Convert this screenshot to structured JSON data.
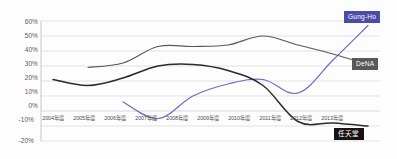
{
  "chart_data": {
    "type": "line",
    "title": "",
    "subtitle": "",
    "xlabel": "",
    "ylabel": "",
    "x": [
      "2004年度",
      "2005年度",
      "2006年度",
      "2007年度",
      "2008年度",
      "2009年度",
      "2010年度",
      "2011年度",
      "2012年度",
      "2013年度"
    ],
    "ylim": [
      -20,
      60
    ],
    "ytick_labels": [
      "60%",
      "50%",
      "40%",
      "30%",
      "20%",
      "10%",
      "0%",
      "-10%",
      "-20%"
    ],
    "ytick_values": [
      60,
      50,
      40,
      30,
      20,
      10,
      0,
      -10,
      -20
    ],
    "grid": true,
    "legend_position": "line-end-labels",
    "series": [
      {
        "name": "Gung-Ho",
        "color": "#6b6bc4",
        "values": [
          null,
          null,
          6,
          -5,
          10,
          18,
          21,
          12,
          34,
          57
        ]
      },
      {
        "name": "DeNA",
        "color": "#5a5a5a",
        "values": [
          null,
          29,
          32,
          43,
          43,
          44,
          50,
          44,
          38,
          31
        ]
      },
      {
        "name": "任天堂",
        "color": "#2b2b2b",
        "values": [
          21,
          17,
          22,
          30,
          31,
          27,
          17,
          -7,
          -8,
          -10
        ]
      }
    ]
  },
  "axis": {
    "ytick_0": "60%",
    "ytick_1": "50%",
    "ytick_2": "40%",
    "ytick_3": "30%",
    "ytick_4": "20%",
    "ytick_5": "10%",
    "ytick_6": "0%",
    "ytick_7": "-10%",
    "ytick_8": "-20%",
    "xtick_0": "2004年度",
    "xtick_1": "2005年度",
    "xtick_2": "2006年度",
    "xtick_3": "2007年度",
    "xtick_4": "2008年度",
    "xtick_5": "2009年度",
    "xtick_6": "2010年度",
    "xtick_7": "2011年度",
    "xtick_8": "2012年度",
    "xtick_9": "2013年度"
  },
  "labels": {
    "gungho": "Gung-Ho",
    "dena": "DeNA",
    "nintendo": "任天堂"
  },
  "colors": {
    "gungho": "#6b6bc4",
    "gungho_badge": "#4b4ba8",
    "dena": "#5a5a5a",
    "dena_badge": "#585858",
    "nintendo": "#2b2b2b",
    "nintendo_badge": "#1a1212",
    "grid": "#d6d6d6",
    "axis_text": "#5a5a5a",
    "background": "#fdfdfd"
  }
}
